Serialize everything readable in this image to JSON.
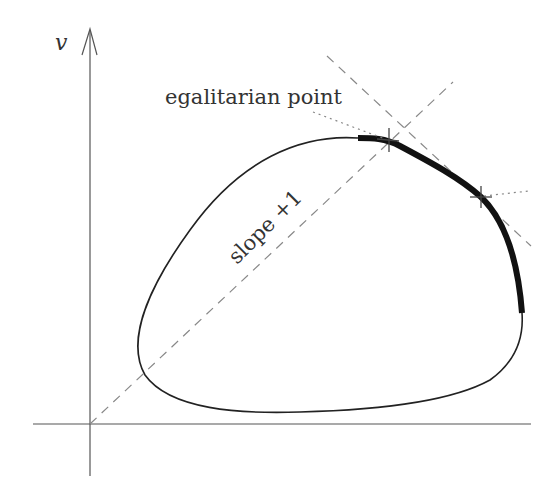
{
  "diagram": {
    "type": "bargaining-set-egalitarian-solution",
    "axes": {
      "y_label": "v",
      "x_label": ""
    },
    "labels": {
      "egalitarian_point": "egalitarian point",
      "slope_line": "slope +1"
    },
    "elements": {
      "feasible_set": "closed convex-like curve (blob)",
      "pareto_frontier": "thick segment on upper-right boundary",
      "diagonal_line": "dashed line of slope +1 through origin",
      "tangent_line": "dashed line of negative slope tangent at frontier",
      "marked_points": [
        "egalitarian point (cross on diagonal)",
        "second point (cross on frontier)"
      ]
    },
    "colors": {
      "axis": "#555555",
      "curve": "#222222",
      "frontier": "#111111",
      "dashed": "#888888",
      "dotted": "#888888",
      "text": "#333333"
    }
  }
}
